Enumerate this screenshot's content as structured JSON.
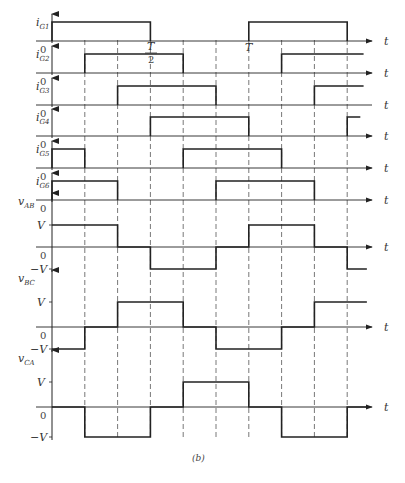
{
  "figure": {
    "caption": "(b)",
    "time_axis_label": "t",
    "zero_label": "0",
    "period_label": "T",
    "half_period_num": "T",
    "half_period_den": "2",
    "colors": {
      "line": "#222222",
      "dashed": "#555555",
      "text": "#333333"
    }
  },
  "timing": {
    "period_fraction_per_division": 0.1667,
    "visible_periods": 1.5,
    "divisions": [
      0,
      1,
      2,
      3,
      4,
      5,
      6,
      7,
      8,
      9
    ]
  },
  "gate_signals": [
    {
      "name": "iG1",
      "label_main": "i",
      "label_sub": "G1",
      "high_intervals": [
        [
          0,
          3
        ],
        [
          6,
          9
        ]
      ]
    },
    {
      "name": "iG2",
      "label_main": "i",
      "label_sub": "G2",
      "high_intervals": [
        [
          1,
          4
        ],
        [
          7,
          9.5
        ]
      ]
    },
    {
      "name": "iG3",
      "label_main": "i",
      "label_sub": "G3",
      "high_intervals": [
        [
          2,
          5
        ],
        [
          8,
          9.5
        ]
      ]
    },
    {
      "name": "iG4",
      "label_main": "i",
      "label_sub": "G4",
      "high_intervals": [
        [
          3,
          6
        ],
        [
          9,
          9.4
        ]
      ]
    },
    {
      "name": "iG5",
      "label_main": "i",
      "label_sub": "G5",
      "high_intervals": [
        [
          0,
          1
        ],
        [
          4,
          7
        ]
      ]
    },
    {
      "name": "iG6",
      "label_main": "i",
      "label_sub": "G6",
      "high_intervals": [
        [
          0,
          2
        ],
        [
          5,
          8
        ]
      ]
    }
  ],
  "voltage_signals": [
    {
      "name": "vAB",
      "label_main": "v",
      "label_sub": "AB",
      "pos_label": "V",
      "neg_label": "−V",
      "levels": [
        [
          0,
          2,
          1
        ],
        [
          2,
          3,
          0
        ],
        [
          3,
          5,
          -1
        ],
        [
          5,
          6,
          0
        ],
        [
          6,
          8,
          1
        ],
        [
          8,
          9,
          0
        ],
        [
          9,
          9.6,
          -1
        ]
      ]
    },
    {
      "name": "vBC",
      "label_main": "v",
      "label_sub": "BC",
      "pos_label": "V",
      "neg_label": "−V",
      "levels": [
        [
          0,
          1,
          -1
        ],
        [
          1,
          2,
          0
        ],
        [
          2,
          4,
          1
        ],
        [
          4,
          5,
          0
        ],
        [
          5,
          7,
          -1
        ],
        [
          7,
          8,
          0
        ],
        [
          8,
          9.6,
          1
        ]
      ]
    },
    {
      "name": "vCA",
      "label_main": "v",
      "label_sub": "CA",
      "pos_label": "V",
      "neg_label": "−V",
      "levels": [
        [
          0,
          1,
          0
        ],
        [
          1,
          3,
          -1
        ],
        [
          3,
          4,
          0
        ],
        [
          4,
          6,
          1
        ],
        [
          6,
          7,
          0
        ],
        [
          7,
          9,
          -1
        ],
        [
          9,
          9.6,
          0
        ]
      ]
    }
  ]
}
